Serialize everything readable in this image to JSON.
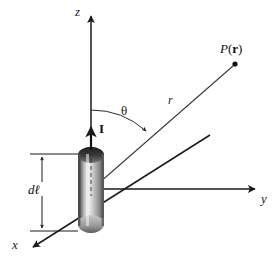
{
  "figure": {
    "kind": "physics-diagram",
    "background_color": "#ffffff",
    "ink_color": "#1a1a1a",
    "labels": {
      "z_axis": "z",
      "y_axis": "y",
      "x_axis": "x",
      "radius": "r",
      "theta": "θ",
      "current": "I",
      "point_p": "P",
      "point_open_paren": "(",
      "point_vector": "r",
      "point_close_paren": ")",
      "element_d": "d",
      "element_ell": "ℓ"
    },
    "geometry": {
      "origin": [
        91,
        190
      ],
      "z_axis_tip": [
        91,
        13
      ],
      "y_axis_tip": [
        258,
        189
      ],
      "x_axis_tip": [
        30,
        250
      ],
      "point_p_dot": [
        235,
        64
      ],
      "current_arrow_tip": [
        91,
        126
      ],
      "cylinder": {
        "left": 78,
        "top": 147,
        "width": 26,
        "height": 86,
        "shading": "vertical rod, dark caps, light vertical highlight"
      },
      "dimension_line": {
        "x": 42,
        "top_y": 155,
        "bottom_y": 231,
        "extension_right_x": 78
      }
    }
  }
}
